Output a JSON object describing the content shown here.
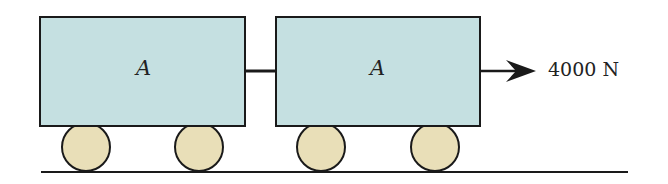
{
  "diagram": {
    "cars": [
      {
        "label": "A"
      },
      {
        "label": "A"
      }
    ],
    "force": {
      "label": "4000 N",
      "direction": "right"
    },
    "colors": {
      "car_fill": "#c5e0e1",
      "wheel_fill": "#e9dfb8",
      "stroke": "#1a1a1a"
    }
  }
}
